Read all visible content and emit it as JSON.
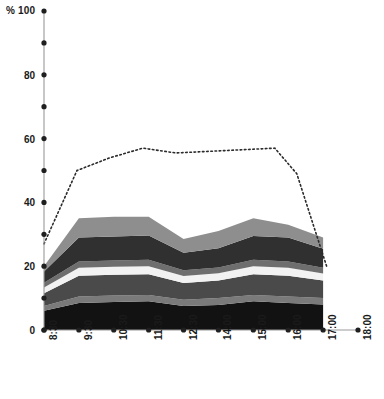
{
  "chart_data": {
    "type": "area",
    "title": "",
    "subtitle": "",
    "xlabel": "",
    "ylabel": "",
    "unit_label": "%",
    "axis_corner_label": "% 100",
    "ylim": [
      0,
      100
    ],
    "xlim_labels": [
      "8:30",
      "18:00"
    ],
    "grid": false,
    "legend": "none",
    "stacked": true,
    "y_ticks_major": [
      0,
      20,
      40,
      60,
      80,
      100
    ],
    "y_ticks_minor": [
      10,
      30,
      50,
      70,
      90
    ],
    "y_tick_labels": [
      "0",
      "20",
      "40",
      "60",
      "80",
      "100"
    ],
    "categories": [
      "8:30",
      "9:30",
      "10:30",
      "11:30",
      "12:30",
      "14:00",
      "15:00",
      "16:00",
      "17:00",
      "18:00"
    ],
    "x": [
      0,
      1,
      2,
      3,
      4,
      5,
      6,
      7,
      8,
      9
    ],
    "series": [
      {
        "name": "band-1",
        "color": "#121212",
        "values": [
          6.0,
          8.5,
          8.8,
          9.0,
          7.5,
          7.8,
          9.0,
          8.5,
          8.0,
          0
        ]
      },
      {
        "name": "band-2",
        "color": "#7a7a7a",
        "values": [
          1.5,
          2.0,
          2.0,
          2.0,
          2.0,
          2.2,
          2.0,
          2.0,
          2.0,
          0
        ]
      },
      {
        "name": "band-3",
        "color": "#4a4a4a",
        "values": [
          4.0,
          6.5,
          6.5,
          6.5,
          5.2,
          5.5,
          6.5,
          6.5,
          5.5,
          0
        ]
      },
      {
        "name": "band-4",
        "color": "#f2f2f2",
        "values": [
          1.8,
          2.5,
          2.5,
          2.5,
          2.2,
          2.3,
          2.5,
          2.5,
          2.2,
          0
        ]
      },
      {
        "name": "band-5",
        "color": "#6e6e6e",
        "values": [
          1.5,
          2.0,
          2.0,
          2.0,
          1.8,
          1.8,
          2.0,
          2.0,
          1.8,
          0
        ]
      },
      {
        "name": "band-6",
        "color": "#303030",
        "values": [
          3.5,
          7.5,
          7.5,
          7.6,
          5.5,
          6.0,
          7.5,
          7.5,
          6.0,
          0
        ]
      },
      {
        "name": "band-7",
        "color": "#8e8e8e",
        "values": [
          1.7,
          6.0,
          6.2,
          5.9,
          4.3,
          5.4,
          5.5,
          4.0,
          3.5,
          0
        ]
      }
    ],
    "overlay_line": {
      "name": "total-dotted",
      "style": "dotted",
      "color": "#2b2b2b",
      "values": [
        27,
        50,
        54,
        57,
        55.5,
        56,
        56.5,
        57,
        49,
        20
      ],
      "x_fraction": [
        0.0,
        0.105,
        0.21,
        0.315,
        0.42,
        0.525,
        0.63,
        0.735,
        0.805,
        0.9
      ]
    }
  }
}
